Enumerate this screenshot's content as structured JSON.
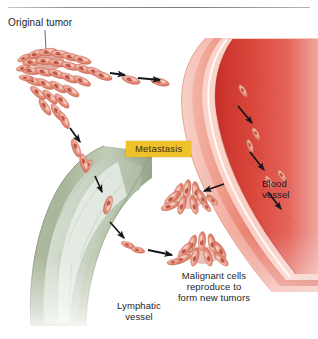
{
  "figure": {
    "title": "Metastasis",
    "width": 318,
    "height": 339,
    "background": "#ffffff"
  },
  "labels": {
    "original_tumor": "Original tumor",
    "metastasis": "Metastasis",
    "blood_vessel": "Blood\nvessel",
    "malignant_cells": "Malignant cells\nreproduce to\nform new tumors",
    "lymphatic_vessel": "Lymphatic\nvessel"
  },
  "colors": {
    "metastasis_box_fill": "#efc12b",
    "metastasis_box_text": "#3a2c12",
    "label_text": "#1c1c28",
    "tumor_cell_light": "#f3b9a6",
    "tumor_cell_mid": "#e08a72",
    "tumor_cell_dark": "#c25a45",
    "tumor_nucleus": "#b4412f",
    "blood_vessel_lumen": "#d3382f",
    "blood_vessel_lumen_light": "#e8685c",
    "blood_vessel_wall_outer": "#e8796a",
    "blood_vessel_wall_inner": "#f4c4b8",
    "blood_vessel_highlight": "#fdf0ea",
    "lymph_vessel_outer": "#9aa78d",
    "lymph_vessel_mid": "#c3cdb8",
    "lymph_vessel_inner": "#e3eae0",
    "lymph_vessel_pale": "#eef3f1",
    "arrow": "#16161c",
    "leader_line": "#5b5b63",
    "rule": "#8f8f8f"
  },
  "structures": [
    {
      "name": "original-tumor",
      "description": "Radiating cluster of elongated malignant cells at upper left"
    },
    {
      "name": "blood-vessel",
      "description": "Large curved red vessel on the right with layered walls and cells travelling inside"
    },
    {
      "name": "lymphatic-vessel",
      "description": "Sage green curved vessel at lower left with cells travelling inside"
    },
    {
      "name": "new-tumor-upper",
      "description": "Small secondary tumor cluster in center right"
    },
    {
      "name": "new-tumor-lower",
      "description": "Small secondary tumor cluster at lower center"
    }
  ],
  "arrows": [
    {
      "name": "tumor-to-vessel-1",
      "direction": "right"
    },
    {
      "name": "tumor-to-vessel-2",
      "direction": "right"
    },
    {
      "name": "tumor-to-lymph",
      "direction": "down"
    },
    {
      "name": "in-lymph-1",
      "direction": "down"
    },
    {
      "name": "in-lymph-2",
      "direction": "down-right"
    },
    {
      "name": "lymph-to-new-tumor",
      "direction": "right"
    },
    {
      "name": "in-blood-1",
      "direction": "down-right"
    },
    {
      "name": "in-blood-2",
      "direction": "down-right"
    },
    {
      "name": "in-blood-3",
      "direction": "down-right"
    },
    {
      "name": "blood-to-new-tumor",
      "direction": "left"
    }
  ]
}
